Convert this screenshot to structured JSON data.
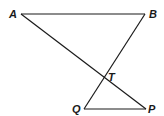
{
  "diagram": {
    "title": "",
    "points": {
      "A": {
        "label": "A",
        "x": 21,
        "y": 14
      },
      "B": {
        "label": "B",
        "x": 145,
        "y": 14
      },
      "T": {
        "label": "T",
        "x": 104,
        "y": 78
      },
      "Q": {
        "label": "Q",
        "x": 84,
        "y": 109
      },
      "P": {
        "label": "P",
        "x": 146,
        "y": 109
      }
    },
    "segments": [
      [
        "A",
        "B"
      ],
      [
        "A",
        "P"
      ],
      [
        "B",
        "Q"
      ],
      [
        "Q",
        "P"
      ]
    ],
    "stroke_color": "#1a1a1a"
  }
}
